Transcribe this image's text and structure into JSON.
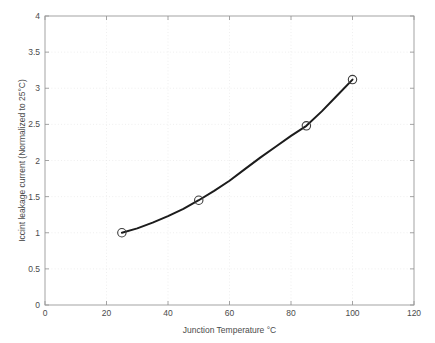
{
  "chart_data": {
    "type": "line",
    "title": "",
    "subtitle": "",
    "xlabel": "Junction Temperature °C",
    "ylabel": "Iccint leakage current (Normalized to 25°C)",
    "xlim": [
      0,
      120
    ],
    "ylim": [
      0,
      4
    ],
    "xticks": [
      0,
      20,
      40,
      60,
      80,
      100,
      120
    ],
    "yticks": [
      0,
      0.5,
      1,
      1.5,
      2,
      2.5,
      3,
      3.5,
      4
    ],
    "xtick_labels": [
      "0",
      "20",
      "40",
      "60",
      "80",
      "100",
      "120"
    ],
    "ytick_labels": [
      "0",
      "0.5",
      "1",
      "1.5",
      "2",
      "2.5",
      "3",
      "3.5",
      "4"
    ],
    "grid": true,
    "grid_style": "dotted",
    "legend": null,
    "legend_position": "none",
    "marker": "circle-open",
    "line_color": "#1c1c1c",
    "marker_color": "#3c3c3c",
    "grid_color": "#e8e8e8",
    "axis_color": "#9a9a9a",
    "background_color": "#ffffff",
    "x": [
      25,
      50,
      85,
      100
    ],
    "values": [
      1.0,
      1.45,
      2.48,
      3.12
    ],
    "series": [
      {
        "name": "Iccint leakage current",
        "x": [
          25,
          50,
          85,
          100
        ],
        "values": [
          1.0,
          1.45,
          2.48,
          3.12
        ]
      }
    ],
    "curve_points": {
      "x": [
        25,
        30,
        35,
        40,
        45,
        50,
        55,
        60,
        65,
        70,
        75,
        80,
        85,
        90,
        95,
        100
      ],
      "y": [
        1.0,
        1.06,
        1.14,
        1.23,
        1.33,
        1.45,
        1.58,
        1.72,
        1.88,
        2.04,
        2.19,
        2.34,
        2.48,
        2.68,
        2.9,
        3.12
      ]
    },
    "annotations": []
  }
}
